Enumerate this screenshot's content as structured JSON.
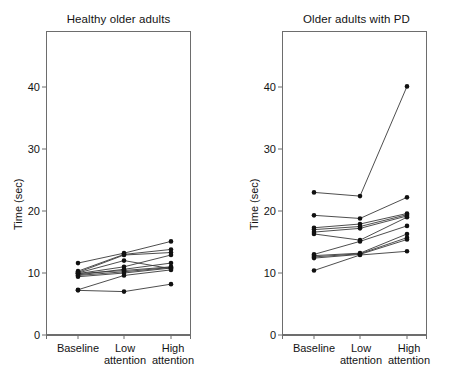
{
  "figure": {
    "background": "#ffffff",
    "ink_color": "#111111",
    "line_color": "#3a3a3a",
    "axis_color": "#6d6d6d"
  },
  "axis": {
    "ylabel": "Time (sec)",
    "yticks": [
      0,
      10,
      20,
      30,
      40
    ],
    "ytick_labels": [
      "0",
      "10",
      "20",
      "30",
      "40"
    ],
    "ylim": [
      0,
      48
    ],
    "xtick_labels": [
      "Baseline",
      "Low attention",
      "High attention"
    ],
    "xtick_line1": [
      "Baseline",
      "Low",
      "High"
    ],
    "xtick_line2": [
      "",
      "attention",
      "attention"
    ],
    "xlabel": "",
    "grid": false,
    "legend": "none"
  },
  "chart_data": [
    {
      "type": "line",
      "title": "Healthy older adults",
      "xlabel": "",
      "ylabel": "Time (sec)",
      "categories": [
        "Baseline",
        "Low attention",
        "High attention"
      ],
      "ylim": [
        0,
        48
      ],
      "yticks": [
        0,
        10,
        20,
        30,
        40
      ],
      "grid": false,
      "legend": "none",
      "marker": "filled-circle",
      "series": [
        {
          "name": "S1",
          "values": [
            11.6,
            13.2,
            15.1
          ]
        },
        {
          "name": "S2",
          "values": [
            10.3,
            13.0,
            13.8
          ]
        },
        {
          "name": "S3",
          "values": [
            10.1,
            12.9,
            13.3
          ]
        },
        {
          "name": "S4",
          "values": [
            9.9,
            11.0,
            12.9
          ]
        },
        {
          "name": "S5",
          "values": [
            9.7,
            10.6,
            11.6
          ]
        },
        {
          "name": "S6",
          "values": [
            9.9,
            10.4,
            11.0
          ]
        },
        {
          "name": "S7",
          "values": [
            9.6,
            10.2,
            10.9
          ]
        },
        {
          "name": "S8",
          "values": [
            9.4,
            10.0,
            10.8
          ]
        },
        {
          "name": "S9",
          "values": [
            10.0,
            12.0,
            10.7
          ]
        },
        {
          "name": "S10",
          "values": [
            7.3,
            9.6,
            10.5
          ]
        },
        {
          "name": "S11",
          "values": [
            7.2,
            7.0,
            8.2
          ]
        }
      ]
    },
    {
      "type": "line",
      "title": "Older adults with PD",
      "xlabel": "",
      "ylabel": "Time (sec)",
      "categories": [
        "Baseline",
        "Low attention",
        "High attention"
      ],
      "ylim": [
        0,
        48
      ],
      "yticks": [
        0,
        10,
        20,
        30,
        40
      ],
      "grid": false,
      "legend": "none",
      "marker": "filled-circle",
      "series": [
        {
          "name": "P1",
          "values": [
            23.0,
            22.4,
            40.1
          ]
        },
        {
          "name": "P2",
          "values": [
            19.3,
            18.8,
            22.2
          ]
        },
        {
          "name": "P3",
          "values": [
            17.3,
            17.9,
            19.6
          ]
        },
        {
          "name": "P4",
          "values": [
            17.0,
            17.5,
            19.4
          ]
        },
        {
          "name": "P5",
          "values": [
            16.6,
            17.2,
            19.2
          ]
        },
        {
          "name": "P6",
          "values": [
            16.3,
            15.3,
            19.0
          ]
        },
        {
          "name": "P7",
          "values": [
            13.0,
            15.1,
            17.6
          ]
        },
        {
          "name": "P8",
          "values": [
            12.8,
            13.2,
            16.3
          ]
        },
        {
          "name": "P9",
          "values": [
            12.6,
            13.1,
            15.7
          ]
        },
        {
          "name": "P10",
          "values": [
            12.4,
            13.0,
            15.4
          ]
        },
        {
          "name": "P11",
          "values": [
            10.4,
            12.9,
            13.5
          ]
        }
      ]
    }
  ]
}
